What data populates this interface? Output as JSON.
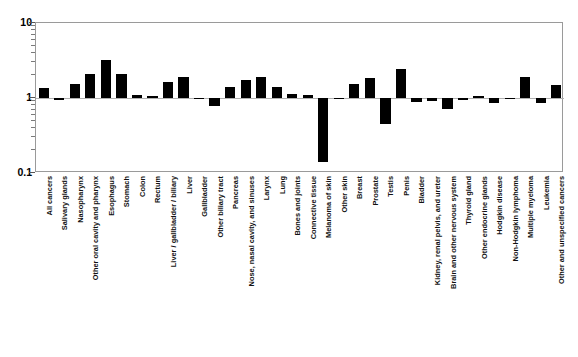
{
  "chart_data": {
    "type": "bar",
    "title": "",
    "subtitle": "",
    "xlabel": "",
    "ylabel": "",
    "ylim": [
      0.1,
      10
    ],
    "yscale": "log",
    "grid": false,
    "legend": null,
    "baseline": 1,
    "ytick_labels": [
      "10",
      "1",
      "0.1"
    ],
    "ytick_values": [
      10,
      1,
      0.1
    ],
    "categories": [
      "All cancers",
      "Salivary glands",
      "Nasopharynx",
      "Other oral cavity and pharynx",
      "Esophagus",
      "Stomach",
      "Colon",
      "Rectum",
      "Liver / gallbladder / biliary",
      "Liver",
      "Gallbladder",
      "Other biliary tract",
      "Pancreas",
      "Nose, nasal cavity, and sinuses",
      "Larynx",
      "Lung",
      "Bones and joints",
      "Connective tissue",
      "Melanoma of skin",
      "Other skin",
      "Breast",
      "Prostate",
      "Testis",
      "Penis",
      "Bladder",
      "Kidney, renal pelvis, and ureter",
      "Brain and other nervous system",
      "Thyroid gland",
      "Other endocrine glands",
      "Hodgkin disease",
      "Non-Hodgkin lymphoma",
      "Multiple myeloma",
      "Leukemia",
      "Other and unspecified cancers"
    ],
    "values": [
      1.35,
      0.93,
      1.55,
      2.1,
      3.25,
      2.1,
      1.08,
      1.06,
      1.65,
      1.9,
      0.96,
      0.78,
      1.42,
      1.75,
      1.9,
      1.42,
      1.12,
      1.1,
      0.14,
      0.98,
      1.55,
      1.85,
      0.45,
      2.4,
      0.88,
      0.9,
      0.72,
      0.93,
      1.05,
      0.86,
      0.96,
      1.9,
      0.87,
      1.5
    ]
  },
  "colors": {
    "bar": "#000000",
    "axis": "#9a9a9a",
    "text": "#111111",
    "background": "#ffffff"
  }
}
